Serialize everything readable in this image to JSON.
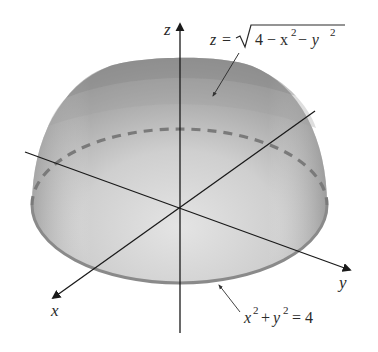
{
  "figure": {
    "surface_label": {
      "lhs": "z",
      "eq": "=",
      "radical_body": "4 − x",
      "sup1": "2",
      "minus": " − y",
      "sup2": "2"
    },
    "boundary_label": {
      "x": "x",
      "sup1": "2",
      "plus": "+",
      "y": "y",
      "sup2": "2",
      "rhs": "= 4"
    },
    "axes": {
      "x": "x",
      "y": "y",
      "z": "z"
    },
    "colors": {
      "dome_dark": "#8c8c8c",
      "dome_mid": "#b5b5b5",
      "dome_light": "#dcdcdc",
      "rim": "#8a8a8a",
      "axis": "#222222"
    }
  }
}
